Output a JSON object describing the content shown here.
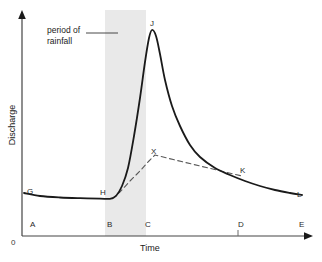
{
  "chart_data": {
    "type": "line",
    "title": "",
    "xlabel": "Time",
    "ylabel": "Discharge",
    "origin_label": "0",
    "grid": false,
    "legend": "none",
    "annotations": [
      {
        "id": "period-of-rainfall",
        "line1": "period of",
        "line2": "rainfall",
        "points_to": "rainfall-band"
      }
    ],
    "shaded_band": {
      "name": "period of rainfall",
      "color": "#e9e9e9",
      "x_start_label": "B",
      "x_end_label": "C"
    },
    "x_axis_ticks": [
      {
        "label": "A",
        "x": 30
      },
      {
        "label": "B",
        "x": 107
      },
      {
        "label": "C",
        "x": 145
      },
      {
        "label": "D",
        "x": 238
      },
      {
        "label": "E",
        "x": 299
      }
    ],
    "curve_point_labels": [
      {
        "label": "G",
        "x": 27,
        "y": 187,
        "desc": "baseflow start"
      },
      {
        "label": "H",
        "x": 100,
        "y": 188,
        "desc": "start of rising limb"
      },
      {
        "label": "J",
        "x": 150,
        "y": 19,
        "desc": "peak discharge"
      },
      {
        "label": "X",
        "x": 151,
        "y": 147,
        "desc": "baseflow separation peak"
      },
      {
        "label": "K",
        "x": 240,
        "y": 166,
        "desc": "end of stormflow"
      },
      {
        "label": "L",
        "x": 297,
        "y": 190,
        "desc": "baseflow resumed"
      }
    ],
    "series": [
      {
        "name": "storm hydrograph discharge",
        "style": "solid",
        "color": "#1a1a1a",
        "points": [
          [
            24,
            193
          ],
          [
            40,
            196
          ],
          [
            60,
            197.5
          ],
          [
            80,
            198.2
          ],
          [
            100,
            198.6
          ],
          [
            110,
            198.8
          ],
          [
            116,
            196
          ],
          [
            122,
            186
          ],
          [
            128,
            168
          ],
          [
            134,
            136
          ],
          [
            140,
            98
          ],
          [
            145,
            62
          ],
          [
            149,
            38
          ],
          [
            152,
            30
          ],
          [
            156,
            36
          ],
          [
            160,
            54
          ],
          [
            165,
            80
          ],
          [
            172,
            106
          ],
          [
            180,
            126
          ],
          [
            190,
            145
          ],
          [
            200,
            157
          ],
          [
            215,
            168
          ],
          [
            230,
            175
          ],
          [
            245,
            181
          ],
          [
            260,
            186
          ],
          [
            275,
            190
          ],
          [
            290,
            193
          ],
          [
            302,
            195
          ]
        ]
      },
      {
        "name": "baseflow separation line",
        "style": "dashed",
        "color": "#5a5a5a",
        "points": [
          [
            112,
            199
          ],
          [
            120,
            192
          ],
          [
            130,
            181
          ],
          [
            140,
            171
          ],
          [
            148,
            162
          ],
          [
            155,
            155
          ],
          [
            175,
            160
          ],
          [
            200,
            166
          ],
          [
            225,
            172
          ],
          [
            242,
            176
          ]
        ]
      }
    ],
    "axis_arrows": {
      "y_axis": "up-arrow",
      "x_axis": "right-arrow"
    }
  }
}
